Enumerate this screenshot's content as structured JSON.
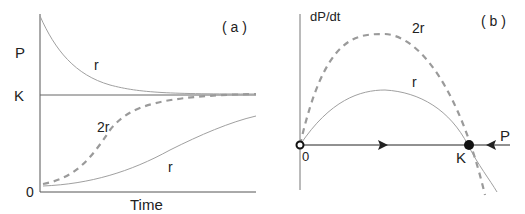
{
  "panel_a": {
    "tag": "( a )",
    "y_label": "P",
    "x_label": "Time",
    "k_label": "K",
    "zero_label": "0",
    "curve_labels": {
      "decay_r": "r",
      "logistic_2r": "2r",
      "logistic_r": "r"
    }
  },
  "panel_b": {
    "tag": "( b )",
    "y_label": "dP/dt",
    "x_label": "P",
    "zero_label": "0",
    "k_label": "K",
    "curve_labels": {
      "parabola_2r": "2r",
      "parabola_r": "r"
    }
  },
  "colors": {
    "axis": "#555555",
    "curve": "#9a9a9a",
    "dashed": "#9a9a9a",
    "point": "#111111"
  }
}
